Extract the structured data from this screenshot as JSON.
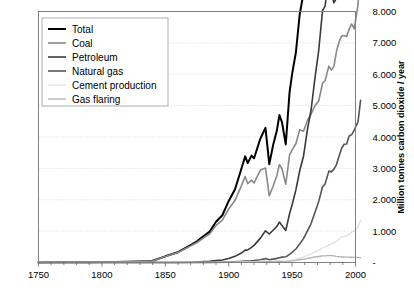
{
  "chart_data": {
    "type": "line",
    "title": "",
    "xlabel": "",
    "ylabel": "Million tonnes carbon dioxide / year",
    "xlim": [
      1750,
      2000
    ],
    "ylim": [
      0,
      8000
    ],
    "grid": true,
    "legend_position": "top-left",
    "x_ticks": [
      "1750",
      "1800",
      "1850",
      "1900",
      "1950",
      "2000"
    ],
    "x_tick_values": [
      1750,
      1800,
      1850,
      1900,
      1950,
      2000
    ],
    "y_ticks": [
      "-",
      "1.000",
      "2.000",
      "3.000",
      "4.000",
      "5.000",
      "6.000",
      "7.000",
      "8.000"
    ],
    "y_tick_values": [
      0,
      1000,
      2000,
      3000,
      4000,
      5000,
      6000,
      7000,
      8000
    ],
    "x": [
      1750,
      1760,
      1770,
      1780,
      1790,
      1800,
      1810,
      1820,
      1830,
      1840,
      1850,
      1860,
      1870,
      1875,
      1880,
      1885,
      1890,
      1895,
      1900,
      1905,
      1910,
      1913,
      1915,
      1918,
      1920,
      1925,
      1929,
      1932,
      1935,
      1938,
      1940,
      1942,
      1945,
      1948,
      1950,
      1953,
      1956,
      1959,
      1962,
      1965,
      1968,
      1971,
      1974,
      1976,
      1979,
      1981,
      1983,
      1985,
      1987,
      1989,
      1991,
      1993,
      1995,
      1997,
      1999,
      2002,
      2004
    ],
    "series": [
      {
        "name": "Total",
        "color": "#000000",
        "width": 2.0,
        "values": [
          3,
          4,
          6,
          8,
          11,
          14,
          18,
          25,
          35,
          54,
          197,
          329,
          557,
          676,
          836,
          984,
          1299,
          1507,
          1962,
          2335,
          2990,
          3382,
          3168,
          3407,
          3322,
          3951,
          4293,
          3133,
          3735,
          4209,
          4698,
          4476,
          3765,
          5425,
          6003,
          6701,
          7912,
          8585,
          10196,
          11471,
          13287,
          14715,
          17164,
          17422,
          19211,
          18889,
          18701,
          19621,
          20803,
          21866,
          22170,
          22244,
          23035,
          23670,
          23867,
          24750,
          27163
        ]
      },
      {
        "name": "Coal",
        "color": "#888888",
        "width": 1.6,
        "values": [
          3,
          4,
          6,
          8,
          11,
          14,
          18,
          25,
          35,
          53,
          192,
          317,
          530,
          638,
          779,
          912,
          1180,
          1353,
          1705,
          1982,
          2443,
          2744,
          2511,
          2626,
          2534,
          2945,
          3012,
          2126,
          2427,
          2775,
          3118,
          2988,
          2494,
          3427,
          3588,
          3785,
          4235,
          4183,
          4518,
          4733,
          4993,
          5152,
          5711,
          5792,
          6258,
          6130,
          6252,
          6726,
          7028,
          7220,
          7234,
          7200,
          7439,
          7603,
          7445,
          8208,
          9490
        ]
      },
      {
        "name": "Petroleum",
        "color": "#3a3a3a",
        "width": 1.6,
        "values": [
          0,
          0,
          0,
          0,
          0,
          0,
          0,
          0,
          0,
          0,
          0,
          1,
          10,
          18,
          30,
          40,
          60,
          82,
          127,
          196,
          302,
          395,
          401,
          482,
          546,
          777,
          1010,
          908,
          1029,
          1150,
          1288,
          1181,
          1020,
          1555,
          1840,
          2314,
          2924,
          3388,
          4216,
          4868,
          5871,
          6764,
          8027,
          8173,
          9102,
          8554,
          8278,
          8425,
          8944,
          9356,
          9513,
          9576,
          9853,
          10172,
          10389,
          10622,
          11420
        ]
      },
      {
        "name": "Natural gas",
        "color": "#555555",
        "width": 1.6,
        "values": [
          0,
          0,
          0,
          0,
          0,
          0,
          0,
          0,
          0,
          0,
          0,
          0,
          1,
          2,
          3,
          5,
          9,
          13,
          19,
          26,
          37,
          47,
          48,
          54,
          60,
          85,
          124,
          85,
          108,
          132,
          153,
          171,
          181,
          261,
          324,
          430,
          587,
          760,
          1001,
          1241,
          1595,
          1947,
          2412,
          2502,
          2912,
          2888,
          2977,
          3122,
          3389,
          3633,
          3769,
          3777,
          4033,
          4077,
          4222,
          4492,
          5170
        ]
      },
      {
        "name": "Cement production",
        "color": "#e2e2e2",
        "width": 1.4,
        "values": [
          0,
          0,
          0,
          0,
          0,
          0,
          0,
          0,
          0,
          0,
          0,
          0,
          0,
          0,
          1,
          2,
          4,
          6,
          9,
          12,
          18,
          22,
          20,
          18,
          26,
          40,
          55,
          28,
          37,
          53,
          54,
          44,
          29,
          61,
          78,
          107,
          143,
          180,
          226,
          274,
          330,
          385,
          466,
          491,
          562,
          586,
          625,
          676,
          739,
          804,
          829,
          850,
          904,
          964,
          1006,
          1140,
          1350
        ]
      },
      {
        "name": "Gas flaring",
        "color": "#b5b5b5",
        "width": 1.4,
        "values": [
          0,
          0,
          0,
          0,
          0,
          0,
          0,
          0,
          0,
          0,
          0,
          0,
          0,
          0,
          0,
          0,
          1,
          2,
          3,
          4,
          6,
          8,
          9,
          10,
          12,
          19,
          27,
          26,
          29,
          32,
          35,
          33,
          31,
          44,
          53,
          68,
          89,
          107,
          126,
          152,
          176,
          193,
          212,
          210,
          225,
          220,
          212,
          196,
          184,
          176,
          178,
          171,
          168,
          166,
          163,
          160,
          155
        ]
      }
    ]
  },
  "legend": {
    "items": [
      {
        "label": "Total",
        "color": "#000000"
      },
      {
        "label": "Coal",
        "color": "#888888"
      },
      {
        "label": "Petroleum",
        "color": "#3a3a3a"
      },
      {
        "label": "Natural gas",
        "color": "#555555"
      },
      {
        "label": "Cement production",
        "color": "#e2e2e2"
      },
      {
        "label": "Gas flaring",
        "color": "#b5b5b5"
      }
    ]
  },
  "axis": {
    "y_axis_title": "Million tonnes carbon dioxide / year",
    "x_tick_labels": [
      "1750",
      "1800",
      "1850",
      "1900",
      "1950",
      "2000"
    ],
    "y_tick_labels": [
      "8.000",
      "7.000",
      "6.000",
      "5.000",
      "4.000",
      "3.000",
      "2.000",
      "1.000",
      "-"
    ]
  },
  "style": {
    "frame_color": "#808080",
    "grid_color": "#cccccc",
    "background": "#ffffff"
  }
}
